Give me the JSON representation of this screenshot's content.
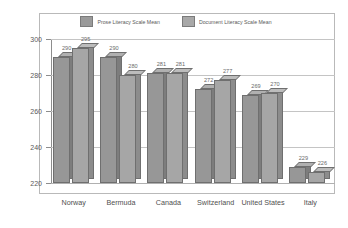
{
  "chart_data": {
    "type": "bar",
    "title": "",
    "subtitle": "",
    "xlabel": "",
    "ylabel": "",
    "ylim": [
      220,
      300
    ],
    "yticks": [
      220,
      240,
      260,
      280,
      300
    ],
    "grid": true,
    "legend_position": "top-center",
    "categories": [
      "Norway",
      "Bermuda",
      "Canada",
      "Switzerland",
      "United States",
      "Italy"
    ],
    "series": [
      {
        "name": "Prose Literacy Scale Mean",
        "color": "#979797",
        "values": [
          290,
          290,
          281,
          272,
          269,
          229
        ]
      },
      {
        "name": "Document Literacy Scale Mean",
        "color": "#a6a6a6",
        "values": [
          295,
          280,
          281,
          277,
          270,
          226
        ]
      }
    ]
  },
  "legend": {
    "entries": [
      {
        "label": "Prose Literacy Scale Mean"
      },
      {
        "label": "Document Literacy Scale Mean"
      }
    ]
  },
  "axis": {
    "y_tick_labels": [
      "300",
      "280",
      "260",
      "240",
      "220"
    ]
  }
}
